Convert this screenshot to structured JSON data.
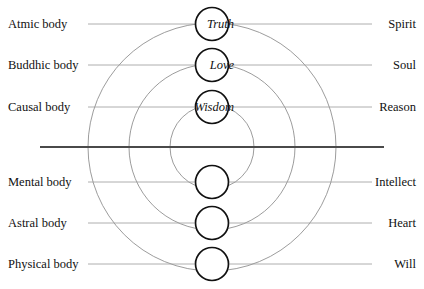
{
  "diagram": {
    "center_x": 212,
    "center_y": 147,
    "divider": {
      "name": "horizontal-divider",
      "x1": 40,
      "x2": 384,
      "y": 147,
      "color": "#4a4a4a",
      "width": 2.2
    },
    "arc_radii": [
      42,
      83,
      124
    ],
    "arc_color": "#8a8a8a",
    "node_radius": 16.5,
    "node_color": "#111111",
    "connector_color": "#9b9b9b",
    "rows": [
      {
        "id": "atmic",
        "left_label": "Atmic body",
        "inner_label": "Truth",
        "right_label": "Spirit",
        "y": 24,
        "half": "upper"
      },
      {
        "id": "buddhic",
        "left_label": "Buddhic body",
        "inner_label": "Love",
        "right_label": "Soul",
        "y": 65,
        "half": "upper"
      },
      {
        "id": "causal",
        "left_label": "Causal body",
        "inner_label": "Wisdom",
        "right_label": "Reason",
        "y": 107,
        "half": "upper"
      },
      {
        "id": "mental",
        "left_label": "Mental body",
        "inner_label": "",
        "right_label": "Intellect",
        "y": 182,
        "half": "lower"
      },
      {
        "id": "astral",
        "left_label": "Astral body",
        "inner_label": "",
        "right_label": "Heart",
        "y": 223,
        "half": "lower"
      },
      {
        "id": "physical",
        "left_label": "Physical body",
        "inner_label": "",
        "right_label": "Will",
        "y": 264,
        "half": "lower"
      }
    ]
  }
}
